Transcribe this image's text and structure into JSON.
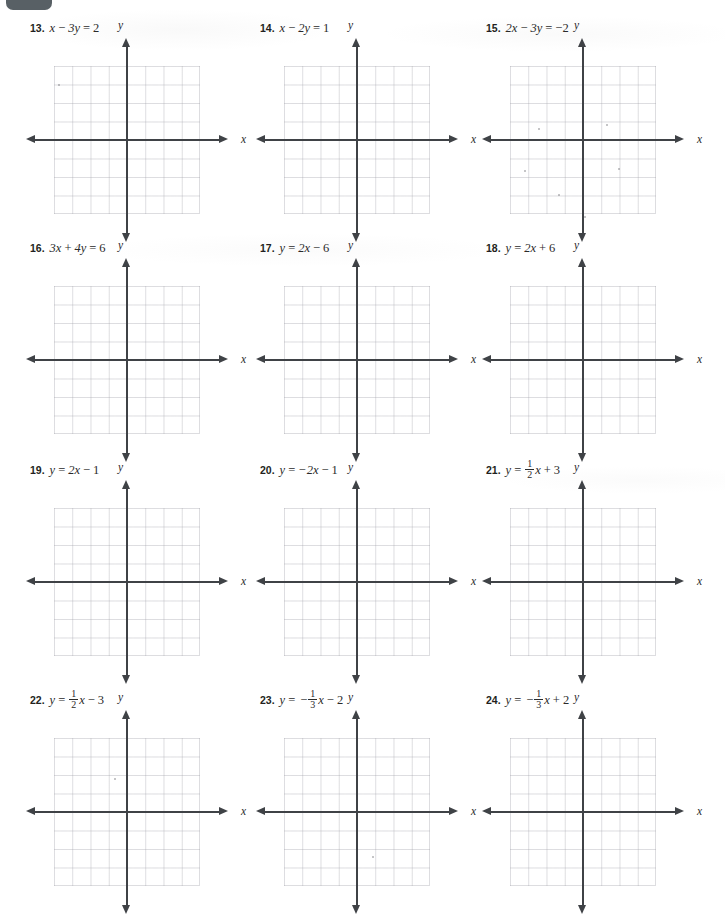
{
  "page": {
    "background_color": "#ffffff",
    "ink_color": "#231f20",
    "grid_line_color": "#8c8c96",
    "axis_color": "#3f4246",
    "corner_tab_color": "#4a5358"
  },
  "axis_labels": {
    "x": "x",
    "y": "y"
  },
  "graph": {
    "columns": 8,
    "rows": 8,
    "x_range": [
      -4,
      4
    ],
    "y_range": [
      -4,
      4
    ],
    "gridlines": true,
    "tick_labels": false
  },
  "problems": [
    {
      "number": "13.",
      "equation_text": "x − 3y = 2",
      "parts": [
        {
          "t": "var",
          "v": "x"
        },
        {
          "t": "op",
          "v": "−"
        },
        {
          "t": "term",
          "v": "3y"
        },
        {
          "t": "op",
          "v": "="
        },
        {
          "t": "num",
          "v": "2"
        }
      ]
    },
    {
      "number": "14.",
      "equation_text": "x − 2y = 1",
      "parts": [
        {
          "t": "var",
          "v": "x"
        },
        {
          "t": "op",
          "v": "−"
        },
        {
          "t": "term",
          "v": "2y"
        },
        {
          "t": "op",
          "v": "="
        },
        {
          "t": "num",
          "v": "1"
        }
      ]
    },
    {
      "number": "15.",
      "equation_text": "2x − 3y = −2",
      "parts": [
        {
          "t": "term",
          "v": "2x"
        },
        {
          "t": "op",
          "v": "−"
        },
        {
          "t": "term",
          "v": "3y"
        },
        {
          "t": "op",
          "v": "="
        },
        {
          "t": "num",
          "v": "−2"
        }
      ]
    },
    {
      "number": "16.",
      "equation_text": "3x + 4y = 6",
      "parts": [
        {
          "t": "term",
          "v": "3x"
        },
        {
          "t": "op",
          "v": "+"
        },
        {
          "t": "term",
          "v": "4y"
        },
        {
          "t": "op",
          "v": "="
        },
        {
          "t": "num",
          "v": "6"
        }
      ]
    },
    {
      "number": "17.",
      "equation_text": "y = 2x − 6",
      "parts": [
        {
          "t": "var",
          "v": "y"
        },
        {
          "t": "op",
          "v": "="
        },
        {
          "t": "term",
          "v": "2x"
        },
        {
          "t": "op",
          "v": "−"
        },
        {
          "t": "num",
          "v": "6"
        }
      ]
    },
    {
      "number": "18.",
      "equation_text": "y = 2x + 6",
      "parts": [
        {
          "t": "var",
          "v": "y"
        },
        {
          "t": "op",
          "v": "="
        },
        {
          "t": "term",
          "v": "2x"
        },
        {
          "t": "op",
          "v": "+"
        },
        {
          "t": "num",
          "v": "6"
        }
      ]
    },
    {
      "number": "19.",
      "equation_text": "y = 2x − 1",
      "parts": [
        {
          "t": "var",
          "v": "y"
        },
        {
          "t": "op",
          "v": "="
        },
        {
          "t": "term",
          "v": "2x"
        },
        {
          "t": "op",
          "v": "−"
        },
        {
          "t": "num",
          "v": "1"
        }
      ]
    },
    {
      "number": "20.",
      "equation_text": "y = −2x − 1",
      "parts": [
        {
          "t": "var",
          "v": "y"
        },
        {
          "t": "op",
          "v": "="
        },
        {
          "t": "term",
          "v": "−2x"
        },
        {
          "t": "op",
          "v": "−"
        },
        {
          "t": "num",
          "v": "1"
        }
      ]
    },
    {
      "number": "21.",
      "equation_text": "y = 1/2 x + 3",
      "parts": [
        {
          "t": "var",
          "v": "y"
        },
        {
          "t": "op",
          "v": "="
        },
        {
          "t": "frac",
          "num": "1",
          "den": "2"
        },
        {
          "t": "var",
          "v": "x"
        },
        {
          "t": "op",
          "v": "+"
        },
        {
          "t": "num",
          "v": "3"
        }
      ]
    },
    {
      "number": "22.",
      "equation_text": "y = 1/2 x − 3",
      "parts": [
        {
          "t": "var",
          "v": "y"
        },
        {
          "t": "op",
          "v": "="
        },
        {
          "t": "frac",
          "num": "1",
          "den": "2"
        },
        {
          "t": "var",
          "v": "x"
        },
        {
          "t": "op",
          "v": "−"
        },
        {
          "t": "num",
          "v": "3"
        }
      ]
    },
    {
      "number": "23.",
      "equation_text": "y = −1/3 x − 2",
      "parts": [
        {
          "t": "var",
          "v": "y"
        },
        {
          "t": "op",
          "v": "="
        },
        {
          "t": "sign",
          "v": "−"
        },
        {
          "t": "frac",
          "num": "1",
          "den": "3"
        },
        {
          "t": "var",
          "v": "x"
        },
        {
          "t": "op",
          "v": "−"
        },
        {
          "t": "num",
          "v": "2"
        }
      ]
    },
    {
      "number": "24.",
      "equation_text": "y = −1/3 x + 2",
      "parts": [
        {
          "t": "var",
          "v": "y"
        },
        {
          "t": "op",
          "v": "="
        },
        {
          "t": "sign",
          "v": "−"
        },
        {
          "t": "frac",
          "num": "1",
          "den": "3"
        },
        {
          "t": "var",
          "v": "x"
        },
        {
          "t": "op",
          "v": "+"
        },
        {
          "t": "num",
          "v": "2"
        }
      ]
    }
  ]
}
